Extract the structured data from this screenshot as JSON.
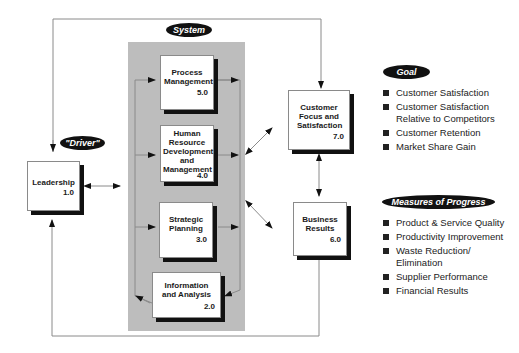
{
  "labels": {
    "system": "System",
    "driver": "\"Driver\"",
    "goal": "Goal",
    "measures": "Measures of Progress"
  },
  "boxes": {
    "leadership": {
      "title": "Leadership",
      "number": "1.0"
    },
    "information": {
      "title": "Information and Analysis",
      "number": "2.0"
    },
    "strategic": {
      "title": "Strategic Planning",
      "number": "3.0"
    },
    "human_resource": {
      "title": "Human Resource Development and Management",
      "number": "4.0"
    },
    "process": {
      "title": "Process Management",
      "number": "5.0"
    },
    "business_results": {
      "title": "Business Results",
      "number": "6.0"
    },
    "customer_focus": {
      "title": "Customer Focus and Satisfaction",
      "number": "7.0"
    }
  },
  "goal_items": [
    "Customer Satisfaction",
    "Customer Satisfaction Relative to Competitors",
    "Customer Retention",
    "Market Share Gain"
  ],
  "measures_items": [
    "Product & Service Quality",
    "Productivity Improvement",
    "Waste Reduction/ Elimination",
    "Supplier Performance",
    "Financial Results"
  ],
  "colors": {
    "panel": "#bdbdbd",
    "pill": "#111111",
    "shadow": "#111111",
    "line": "#8a8a8a"
  }
}
